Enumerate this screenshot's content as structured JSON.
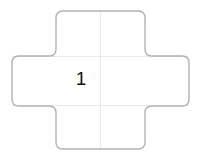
{
  "diagram": {
    "kind": "cross-net",
    "title": "",
    "background_color": "#ffffff",
    "outline_color": "#b0b0b0",
    "outline_width": 1.4,
    "grid_color": "#e8e8e8",
    "grid_width": 1,
    "corner_radius": 7,
    "label_color": "#141414",
    "geometry": {
      "left": 12,
      "right": 189,
      "top": 11,
      "bottom": 149,
      "arm_left": 56,
      "arm_right": 145,
      "arm_top": 56,
      "arm_bottom": 106,
      "grid_vertical_x": 100,
      "grid_horizontal_top_y": 56,
      "grid_horizontal_bottom_y": 106
    },
    "panels": [
      {
        "name": "top-panel",
        "label": ""
      },
      {
        "name": "left-panel",
        "label": ""
      },
      {
        "name": "center-panel",
        "label": "1"
      },
      {
        "name": "right-panel",
        "label": ""
      },
      {
        "name": "bottom-panel",
        "label": ""
      }
    ],
    "labels": {
      "center": "1"
    }
  }
}
